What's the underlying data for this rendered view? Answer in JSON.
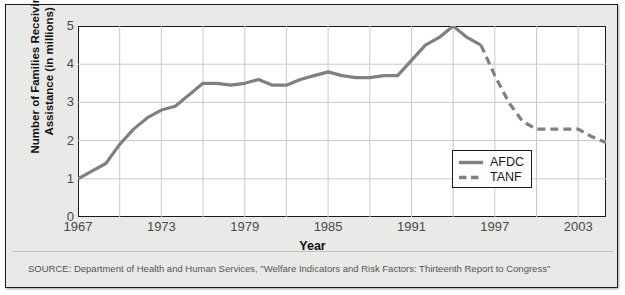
{
  "figure": {
    "background_color": "#e9e9e7",
    "plot_background_color": "#ffffff",
    "border_color": "#1a1a1a",
    "grid_color": "#c9c9c9"
  },
  "source_note": "SOURCE: Department of Health and Human Services, \"Welfare Indicators and Risk Factors: Thirteenth Report to Congress\"",
  "legend": {
    "position": "bottom-right-inside",
    "entries": [
      {
        "label": "AFDC",
        "style": "solid",
        "color": "#808080"
      },
      {
        "label": "TANF",
        "style": "dashed",
        "color": "#808080"
      }
    ]
  },
  "chart_data": {
    "type": "line",
    "title": "",
    "xlabel": "Year",
    "ylabel": "Number of Families Receiving Assistance (in millions)",
    "ylabel_line1": "Number of Families Receiving",
    "ylabel_line2": "Assistance (in millions)",
    "xlim": [
      1967,
      2005
    ],
    "ylim": [
      0,
      5
    ],
    "yticks": [
      5,
      4,
      3,
      2,
      1,
      0
    ],
    "ytick_labels": [
      "5",
      "4",
      "3",
      "2",
      "1",
      "0"
    ],
    "xticks": [
      1967,
      1973,
      1979,
      1985,
      1991,
      1997,
      2003
    ],
    "xtick_labels": [
      "1967",
      "1973",
      "1979",
      "1985",
      "1991",
      "1997",
      "2003"
    ],
    "x_gridline_years": [
      1970,
      1973,
      1976,
      1979,
      1982,
      1985,
      1988,
      1991,
      1994,
      1997,
      2000,
      2003
    ],
    "y_gridline_values": [
      1,
      2,
      3,
      4
    ],
    "grid": true,
    "line_width": 3.2,
    "series": [
      {
        "name": "AFDC",
        "style": "solid",
        "color": "#808080",
        "x": [
          1967,
          1968,
          1969,
          1970,
          1971,
          1972,
          1973,
          1974,
          1975,
          1976,
          1977,
          1978,
          1979,
          1980,
          1981,
          1982,
          1983,
          1984,
          1985,
          1986,
          1987,
          1988,
          1989,
          1990,
          1991,
          1992,
          1993,
          1994,
          1995,
          1996
        ],
        "values": [
          1.0,
          1.2,
          1.4,
          1.9,
          2.3,
          2.6,
          2.8,
          2.9,
          3.2,
          3.5,
          3.5,
          3.45,
          3.5,
          3.6,
          3.45,
          3.45,
          3.6,
          3.7,
          3.8,
          3.7,
          3.65,
          3.65,
          3.7,
          3.7,
          4.1,
          4.5,
          4.7,
          5.0,
          4.7,
          4.5
        ]
      },
      {
        "name": "TANF",
        "style": "dashed",
        "color": "#808080",
        "x": [
          1996,
          1997,
          1998,
          1999,
          2000,
          2001,
          2002,
          2003,
          2004,
          2005
        ],
        "values": [
          4.5,
          3.7,
          3.0,
          2.5,
          2.3,
          2.3,
          2.3,
          2.3,
          2.1,
          1.95
        ]
      }
    ]
  }
}
